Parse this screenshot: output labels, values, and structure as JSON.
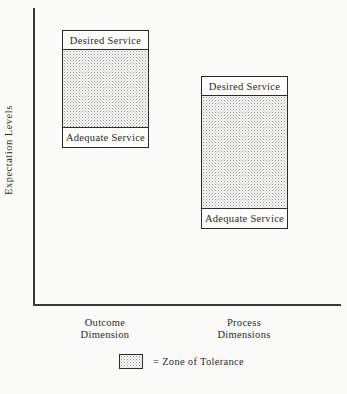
{
  "figure": {
    "y_axis_label": "Expectation Levels",
    "columns": [
      {
        "box": {
          "top_label": "Desired Service",
          "bottom_label": "Adequate Service",
          "middle": "zone-of-tolerance-stipple"
        },
        "axis_label_line1": "Outcome",
        "axis_label_line2": "Dimension"
      },
      {
        "box": {
          "top_label": "Desired Service",
          "bottom_label": "Adequate Service",
          "middle": "zone-of-tolerance-stipple"
        },
        "axis_label_line1": "Process",
        "axis_label_line2": "Dimensions"
      }
    ],
    "legend": {
      "label": "= Zone of Tolerance"
    },
    "colors": {
      "ink": "#2a2a2a",
      "background": "#fbfbf9",
      "stipple_dot": "#989898"
    }
  }
}
